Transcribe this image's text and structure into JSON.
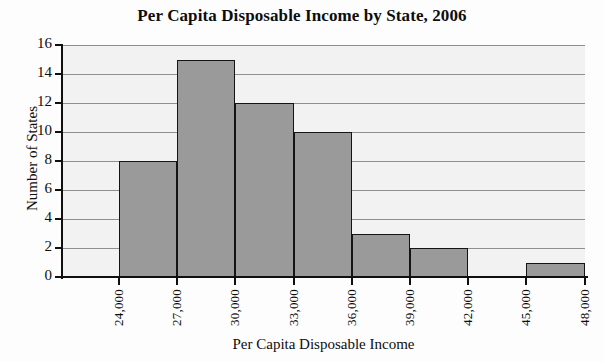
{
  "chart_data": {
    "type": "bar",
    "title": "Per Capita Disposable Income by State, 2006",
    "xlabel": "Per Capita Disposable Income",
    "ylabel": "Number of States",
    "grid": true,
    "legend": false,
    "xlim": [
      21000,
      48000
    ],
    "ylim": [
      0,
      16
    ],
    "bin_width": 3000,
    "bin_edges": [
      "24,000",
      "27,000",
      "30,000",
      "33,000",
      "36,000",
      "39,000",
      "42,000",
      "45,000",
      "48,000"
    ],
    "categories": [
      "24,000-27,000",
      "27,000-30,000",
      "30,000-33,000",
      "33,000-36,000",
      "36,000-39,000",
      "39,000-42,000",
      "42,000-45,000",
      "45,000-48,000"
    ],
    "values": [
      8,
      15,
      12,
      10,
      3,
      2,
      0,
      1
    ],
    "x_tick_labels": [
      "24,000",
      "27,000",
      "30,000",
      "33,000",
      "36,000",
      "39,000",
      "42,000",
      "45,000",
      "48,000"
    ],
    "y_tick_labels": [
      "0",
      "2",
      "4",
      "6",
      "8",
      "10",
      "12",
      "14",
      "16"
    ],
    "y_ticks": [
      0,
      2,
      4,
      6,
      8,
      10,
      12,
      14,
      16
    ],
    "bar_color": "#9a9a9a",
    "bar_edge_color": "#141414",
    "plot_background": "#f2f2f2",
    "gridline_color": "#8f8f8f",
    "axis_color": "#101010"
  }
}
